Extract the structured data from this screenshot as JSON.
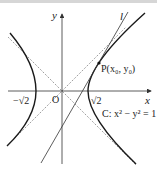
{
  "figure": {
    "type": "hyperbola-tangent-diagram",
    "axes": {
      "x_label": "x",
      "y_label": "y",
      "origin_label": "O"
    },
    "ticks": {
      "neg_sqrt2": "−√2",
      "pos_sqrt2": "√2"
    },
    "curve_label": "C: x² − y² = 1",
    "point_label": "P(x₀, y₀)",
    "line_label": "l",
    "colors": {
      "curve": "#1a1a1a",
      "axis": "#333333",
      "asymptote": "#888888",
      "tangent": "#333333"
    }
  }
}
